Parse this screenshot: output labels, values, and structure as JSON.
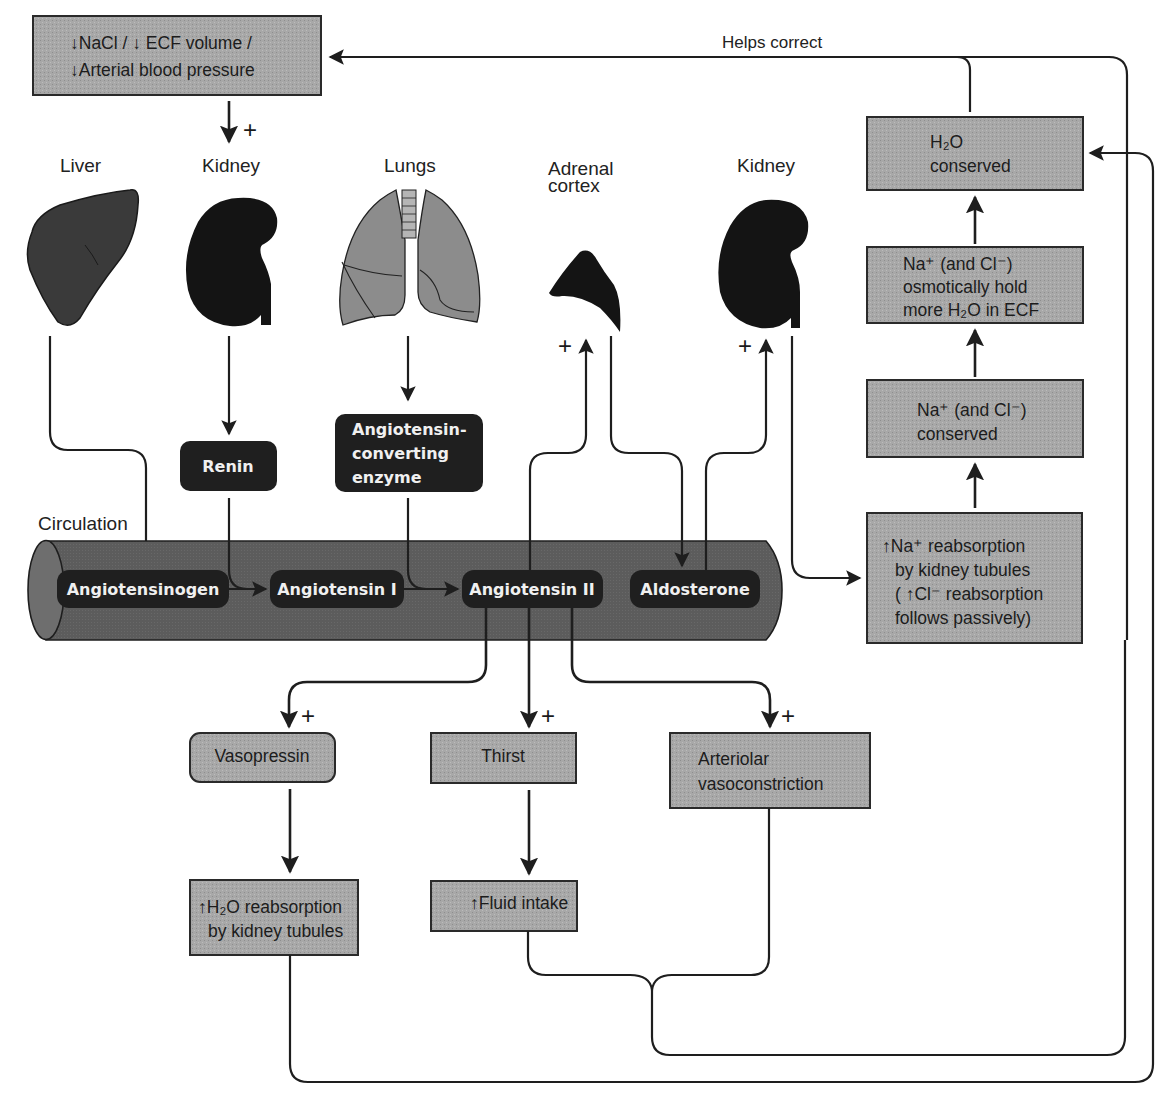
{
  "diagram": {
    "colors": {
      "box_fill": "#a6a6a6",
      "box_border": "#2a2a2a",
      "pill_fill": "#1f1f1f",
      "pill_text": "#f0f0f0",
      "vessel_fill": "#5e5e5e",
      "organ_dark": "#141414",
      "liver_fill": "#3a3a3a",
      "lung_fill": "#8c8c8c"
    },
    "trigger": {
      "line1": "↓NaCl / ↓ ECF volume /",
      "line2": "↓Arterial blood pressure"
    },
    "feedback_label": "Helps correct",
    "organs": {
      "liver": "Liver",
      "kidney_1": "Kidney",
      "lungs": "Lungs",
      "adrenal_line1": "Adrenal",
      "adrenal_line2": "cortex",
      "kidney_2": "Kidney"
    },
    "enzymes": {
      "renin": "Renin",
      "ace_line1": "Angiotensin-",
      "ace_line2": "converting",
      "ace_line3": "enzyme"
    },
    "circulation": {
      "label": "Circulation",
      "molecules": [
        "Angiotensinogen",
        "Angiotensin I",
        "Angiotensin II",
        "Aldosterone"
      ]
    },
    "right_column": {
      "reabsorption": [
        "↑Na⁺ reabsorption",
        "by kidney tubules",
        "( ↑Cl⁻ reabsorption",
        "follows passively)"
      ],
      "na_conserved": [
        "Na⁺ (and Cl⁻)",
        "conserved"
      ],
      "osmotic": [
        "Na⁺ (and Cl⁻)",
        "osmotically hold",
        "more H₂O in ECF"
      ],
      "h2o_conserved": [
        "H₂O",
        "conserved"
      ]
    },
    "effects": {
      "vasopressin": "Vasopressin",
      "thirst": "Thirst",
      "arteriolar": [
        "Arteriolar",
        "vasoconstriction"
      ],
      "h2o_reabsorption": [
        "↑H₂O reabsorption",
        "by kidney tubules"
      ],
      "fluid_intake": "↑Fluid intake"
    },
    "signs": {
      "stimulate": "+"
    }
  }
}
